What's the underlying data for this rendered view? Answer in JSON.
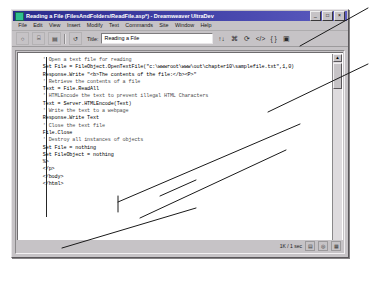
{
  "window": {
    "title": "Reading a File (FilesAndFolders/ReadFile.asp*) - Dreamweaver UltraDev",
    "icon": "dreamweaver-icon",
    "buttons": [
      {
        "name": "minimize-button",
        "glyph": "_"
      },
      {
        "name": "maximize-button",
        "glyph": "□"
      },
      {
        "name": "close-button",
        "glyph": "×"
      }
    ]
  },
  "menu": {
    "items": [
      {
        "name": "menu-file",
        "label": "File"
      },
      {
        "name": "menu-edit",
        "label": "Edit"
      },
      {
        "name": "menu-view",
        "label": "View"
      },
      {
        "name": "menu-insert",
        "label": "Insert"
      },
      {
        "name": "menu-modify",
        "label": "Modify"
      },
      {
        "name": "menu-text",
        "label": "Text"
      },
      {
        "name": "menu-commands",
        "label": "Commands"
      },
      {
        "name": "menu-site",
        "label": "Site"
      },
      {
        "name": "menu-window",
        "label": "Window"
      },
      {
        "name": "menu-help",
        "label": "Help"
      }
    ]
  },
  "toolbar": {
    "left_icons": [
      {
        "name": "show-code-view-icon",
        "glyph": "○"
      },
      {
        "name": "show-code-and-design-view-icon",
        "glyph": "⌸"
      },
      {
        "name": "show-design-view-icon",
        "glyph": "▤"
      },
      {
        "name": "live-data-view-icon",
        "glyph": "↺"
      }
    ],
    "title_label": "Title:",
    "title_value": "Reading a File",
    "right_icons": [
      {
        "name": "file-management-icon",
        "glyph": "↑↓"
      },
      {
        "name": "preview-in-browser-icon",
        "glyph": "⌘"
      },
      {
        "name": "refresh-design-view-icon",
        "glyph": "⟳"
      },
      {
        "name": "reference-icon",
        "glyph": "</>"
      },
      {
        "name": "code-navigation-icon",
        "glyph": "{ }"
      },
      {
        "name": "view-options-icon",
        "glyph": "▣"
      }
    ]
  },
  "code": {
    "caret_visible": true,
    "lines": [
      {
        "text": "      ' Open a text file for reading",
        "style": "comment"
      },
      {
        "text": "      Set File = FileObject.OpenTextFile(\"c:\\wwwroot\\www\\out\\chapter10\\samplefile.txt\",1,0)",
        "style": "code"
      },
      {
        "text": "",
        "style": "blank"
      },
      {
        "text": "      Response.Write \"<b>The contents of the file:</b><P>\"",
        "style": "code"
      },
      {
        "text": "",
        "style": "blank"
      },
      {
        "text": "      ' Retrieve the contents of a file",
        "style": "comment"
      },
      {
        "text": "      Text = File.ReadAll",
        "style": "code"
      },
      {
        "text": "",
        "style": "blank"
      },
      {
        "text": "      ' HTMLEncode the text to prevent illegal HTML Characters",
        "style": "comment"
      },
      {
        "text": "      Text = Server.HTMLEncode(Text)",
        "style": "code"
      },
      {
        "text": "",
        "style": "blank"
      },
      {
        "text": "      ' Write the text to a webpage",
        "style": "comment"
      },
      {
        "text": "      Response.Write Text",
        "style": "code"
      },
      {
        "text": "",
        "style": "blank"
      },
      {
        "text": "      ' Close the text file",
        "style": "comment"
      },
      {
        "text": "      File.Close",
        "style": "code"
      },
      {
        "text": "",
        "style": "blank"
      },
      {
        "text": "      ' Destroy all instances of objects",
        "style": "comment"
      },
      {
        "text": "      Set File = nothing",
        "style": "code"
      },
      {
        "text": "      Set FileObject = nothing",
        "style": "code"
      },
      {
        "text": "      %>",
        "style": "code"
      },
      {
        "text": "      </p>",
        "style": "code"
      },
      {
        "text": "",
        "style": "blank"
      },
      {
        "text": "      </body>",
        "style": "code"
      },
      {
        "text": "      </html>",
        "style": "code"
      }
    ]
  },
  "scrollbar": {
    "up_glyph": "▲",
    "down_glyph": "▼"
  },
  "status": {
    "left_text": "",
    "size_text": "1K / 1 sec",
    "indicators": [
      {
        "name": "status-indicator-1",
        "glyph": "▤"
      },
      {
        "name": "status-indicator-2",
        "glyph": "◎"
      },
      {
        "name": "status-indicator-3",
        "glyph": "▦"
      }
    ]
  },
  "colors": {
    "titlebar_start": "#2a2a8c",
    "titlebar_end": "#5c5cc0",
    "window_face": "#c6c3c6",
    "code_background": "#ffffff",
    "annotation_stroke": "#1a1a1a"
  }
}
